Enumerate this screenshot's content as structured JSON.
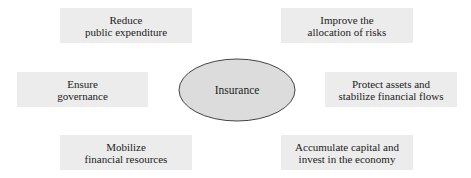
{
  "center": {
    "label": "Insurance"
  },
  "nodes": [
    {
      "id": "top-left",
      "line1": "Reduce",
      "line2": "public expenditure"
    },
    {
      "id": "top-right",
      "line1": "Improve the",
      "line2": "allocation of risks"
    },
    {
      "id": "mid-left",
      "line1": "Ensure",
      "line2": "governance"
    },
    {
      "id": "mid-right",
      "line1": "Protect assets and",
      "line2": "stabilize financial flows"
    },
    {
      "id": "bottom-left",
      "line1": "Mobilize",
      "line2": "financial resources"
    },
    {
      "id": "bottom-right",
      "line1": "Accumulate capital and",
      "line2": "invest in the economy"
    }
  ],
  "colors": {
    "box_fill": "#ececec",
    "ellipse_fill": "#dcdcdc",
    "ellipse_stroke": "#444444"
  }
}
